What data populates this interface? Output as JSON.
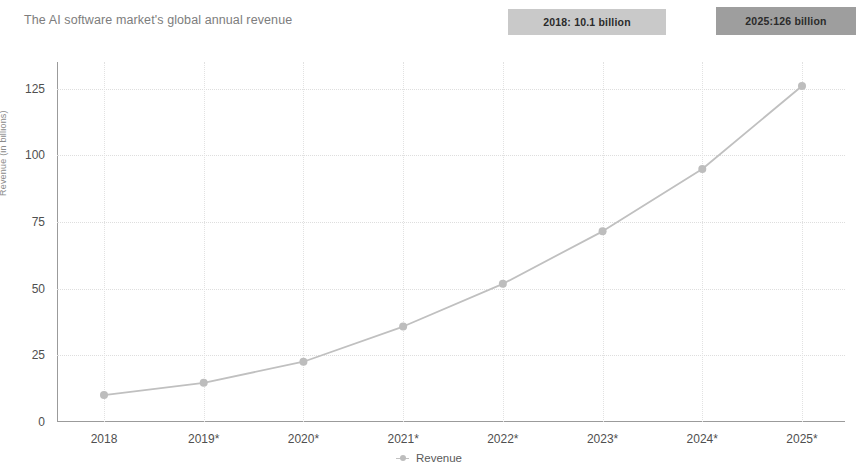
{
  "header": {
    "title": "The AI software market's global annual revenue"
  },
  "annotations": [
    {
      "id": "annotation-2018",
      "text": "2018: 10.1 billion",
      "bg": "#c9c9c9"
    },
    {
      "id": "annotation-2025",
      "text": "2025:126 billion",
      "bg": "#9e9e9e"
    }
  ],
  "legend": {
    "items": [
      {
        "label": "Revenue",
        "color": "#bdbdbd"
      }
    ]
  },
  "chart_data": {
    "type": "line",
    "title": "The AI software market's global annual revenue",
    "xlabel": "",
    "ylabel": "Revenue (in billions)",
    "categories": [
      "2018",
      "2019*",
      "2020*",
      "2021*",
      "2022*",
      "2023*",
      "2024*",
      "2025*"
    ],
    "values": [
      10.1,
      14.7,
      22.6,
      35.8,
      51.8,
      71.5,
      94.9,
      126.0
    ],
    "series": [
      {
        "name": "Revenue",
        "color": "#c0c0c0",
        "values": [
          10.1,
          14.7,
          22.6,
          35.8,
          51.8,
          71.5,
          94.9,
          126.0
        ]
      }
    ],
    "ylim": [
      0,
      135
    ],
    "yticks": [
      0,
      25,
      50,
      75,
      100,
      125
    ],
    "ytick_labels": [
      "0",
      "25",
      "50",
      "75",
      "100",
      "125"
    ],
    "grid": true,
    "grid_style": "dotted",
    "legend_position": "bottom"
  }
}
